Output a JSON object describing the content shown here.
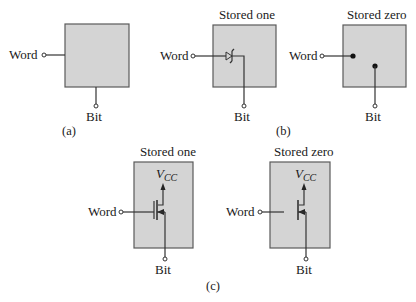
{
  "figure": {
    "colors": {
      "cell_fill": "#d4d4d4",
      "cell_border": "#5a5a5a",
      "wire": "#333333",
      "background": "#ffffff"
    },
    "panel_a": {
      "caption": "(a)",
      "cell": {
        "word_label": "Word",
        "bit_label": "Bit"
      }
    },
    "panel_b": {
      "caption": "(b)",
      "stored_one": {
        "title": "Stored one",
        "word_label": "Word",
        "bit_label": "Bit",
        "element": "diode-icon"
      },
      "stored_zero": {
        "title": "Stored zero",
        "word_label": "Word",
        "bit_label": "Bit",
        "element": "open-connection-dots"
      }
    },
    "panel_c": {
      "caption": "(c)",
      "stored_one": {
        "title": "Stored one",
        "supply_label_main": "V",
        "supply_label_sub": "CC",
        "word_label": "Word",
        "bit_label": "Bit",
        "element": "mosfet-connected-gate-icon"
      },
      "stored_zero": {
        "title": "Stored zero",
        "supply_label_main": "V",
        "supply_label_sub": "CC",
        "word_label": "Word",
        "bit_label": "Bit",
        "element": "mosfet-disconnected-gate-icon"
      }
    }
  }
}
